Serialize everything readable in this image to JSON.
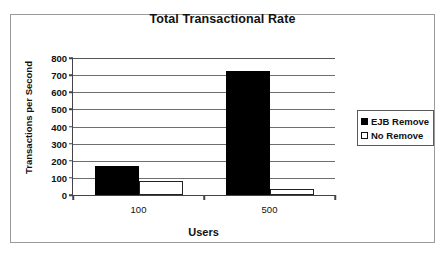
{
  "figure": {
    "border_color": "#9a9a9a"
  },
  "chart_data": {
    "type": "bar",
    "title": "Total Transactional Rate",
    "xlabel": "Users",
    "ylabel": "Transactions per Second",
    "categories": [
      "100",
      "500"
    ],
    "series": [
      {
        "name": "EJB Remove",
        "values": [
          170,
          725
        ],
        "color": "#000000",
        "fill": "solid"
      },
      {
        "name": "No Remove",
        "values": [
          80,
          35
        ],
        "color": "#ffffff",
        "fill": "hollow"
      }
    ],
    "ylim": [
      0,
      800
    ],
    "ytick_step": 100,
    "yticks": [
      0,
      100,
      200,
      300,
      400,
      500,
      600,
      700,
      800
    ],
    "ytick_labels": [
      "0",
      "100",
      "200",
      "300",
      "400",
      "500",
      "600",
      "700",
      "800"
    ],
    "grid": true,
    "grid_axis": "y",
    "legend": true,
    "legend_position": "right",
    "legend_entries": [
      "EJB Remove",
      "No Remove"
    ]
  }
}
